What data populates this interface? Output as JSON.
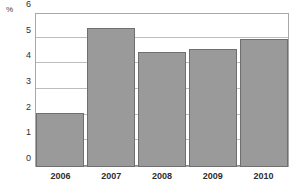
{
  "chart_data": {
    "type": "bar",
    "title": "",
    "xlabel": "",
    "ylabel": "%",
    "unit_label": "%",
    "categories": [
      "2006",
      "2007",
      "2008",
      "2009",
      "2010"
    ],
    "values": [
      2.1,
      5.4,
      4.5,
      4.6,
      5.0
    ],
    "series": [
      {
        "name": "",
        "values": [
          2.1,
          5.4,
          4.5,
          4.6,
          5.0
        ]
      }
    ],
    "ylim": [
      0,
      6
    ],
    "yticks": [
      0,
      1,
      2,
      3,
      4,
      5,
      6
    ],
    "ytick_labels": [
      "0",
      "1",
      "2",
      "3",
      "4",
      "5",
      "6"
    ],
    "grid": "horizontal",
    "legend": "none",
    "bar_color": "#9a9a9a",
    "bar_border_color": "#6f6f6f",
    "gridline_color": "#bdbdbd",
    "axis_color": "#a8a8a8",
    "text_color": "#2e2e2e",
    "background_color": "#ffffff"
  }
}
